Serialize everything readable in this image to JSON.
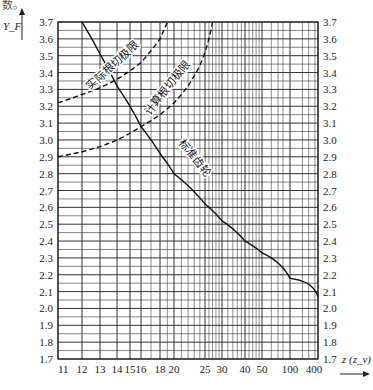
{
  "page": {
    "top_fragment": "数。"
  },
  "chart_data": {
    "type": "line",
    "title": "",
    "xlabel": "z (z_v)",
    "ylabel": "Y_F",
    "x_scale": "nonlinear (approx. reciprocal 1/z)",
    "x_ticks": [
      11,
      12,
      13,
      14,
      15,
      16,
      18,
      20,
      25,
      30,
      40,
      50,
      100,
      400
    ],
    "x_tick_labels": [
      "11",
      "12",
      "13",
      "14",
      "15",
      "16",
      "18",
      "20",
      "25",
      "30",
      "40",
      "50",
      "100",
      "400"
    ],
    "y_ticks": [
      1.7,
      1.8,
      1.9,
      2.0,
      2.1,
      2.2,
      2.3,
      2.4,
      2.5,
      2.6,
      2.7,
      2.8,
      2.9,
      3.0,
      3.1,
      3.2,
      3.3,
      3.4,
      3.5,
      3.6,
      3.7
    ],
    "y_tick_labels": [
      "1.7",
      "1.8",
      "1.9",
      "2.0",
      "2.1",
      "2.2",
      "2.3",
      "2.4",
      "2.5",
      "2.6",
      "2.7",
      "2.8",
      "2.9",
      "3.0",
      "3.1",
      "3.2",
      "3.3",
      "3.4",
      "3.5",
      "3.6",
      "3.7"
    ],
    "ylim": [
      1.7,
      3.7
    ],
    "grid": true,
    "y_axis_both_sides": true,
    "series": [
      {
        "name": "标准齿轮",
        "style": "solid",
        "x": [
          12.0,
          14,
          16,
          18,
          20,
          25,
          30,
          40,
          50,
          100,
          400
        ],
        "y": [
          3.7,
          3.32,
          3.08,
          2.92,
          2.8,
          2.62,
          2.52,
          2.4,
          2.33,
          2.18,
          2.07
        ]
      },
      {
        "name": "实际根切极限",
        "style": "dashed",
        "x": [
          11,
          12,
          13,
          14,
          15,
          16,
          17,
          18,
          19
        ],
        "y": [
          3.22,
          3.27,
          3.31,
          3.36,
          3.41,
          3.46,
          3.53,
          3.6,
          3.7
        ]
      },
      {
        "name": "计算根切极限",
        "style": "dashed",
        "x": [
          11,
          12,
          13,
          14,
          15,
          16,
          18,
          20,
          22,
          24,
          26,
          27
        ],
        "y": [
          2.9,
          2.93,
          2.96,
          3.0,
          3.04,
          3.08,
          3.15,
          3.22,
          3.32,
          3.44,
          3.6,
          3.7
        ]
      }
    ],
    "annotations": [
      "实际根切极限",
      "计算根切极限",
      "标准齿轮"
    ]
  }
}
